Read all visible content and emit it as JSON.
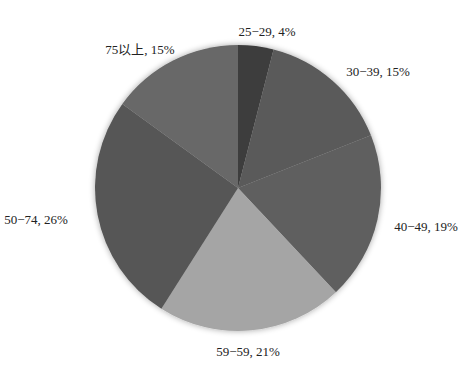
{
  "chart_data": {
    "type": "pie",
    "title": "",
    "start": "top",
    "direction": "clockwise",
    "legend": "none",
    "slices": [
      {
        "label": "25−29",
        "value": 4,
        "display": "25−29, 4%",
        "color": "#3c3c3c"
      },
      {
        "label": "30−39",
        "value": 15,
        "display": "30−39, 15%",
        "color": "#5a5a5a"
      },
      {
        "label": "40−49",
        "value": 19,
        "display": "40−49, 19%",
        "color": "#5f5f5f"
      },
      {
        "label": "59−59",
        "value": 21,
        "display": "59−59, 21%",
        "color": "#a5a5a5"
      },
      {
        "label": "50−74",
        "value": 26,
        "display": "50−74, 26%",
        "color": "#565656"
      },
      {
        "label": "75以上",
        "value": 15,
        "display": "75以上, 15%",
        "color": "#676767"
      }
    ],
    "unit": "%"
  }
}
